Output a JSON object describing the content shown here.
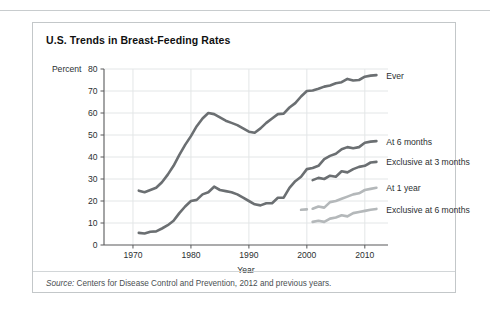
{
  "figure": {
    "title": "U.S. Trends in Breast-Feeding Rates",
    "source_prefix": "Source:",
    "source_text": " Centers for Disease Control and Prevention, 2012 and previous years."
  },
  "colors": {
    "dark_series": "#6b6f72",
    "light_series": "#b4b8ba",
    "axis": "#58595b",
    "grid": "#e3e6e7",
    "border": "#c3c7c9",
    "text": "#2b2f31"
  },
  "chart_data": {
    "type": "line",
    "title": "U.S. Trends in Breast-Feeding Rates",
    "xlabel": "Year",
    "ylabel": "Percent",
    "xlim": [
      1965,
      2014
    ],
    "ylim": [
      0,
      80
    ],
    "xticks": [
      1970,
      1980,
      1990,
      2000,
      2010
    ],
    "yticks": [
      0,
      10,
      20,
      30,
      40,
      50,
      60,
      70,
      80
    ],
    "grid": true,
    "legend": "right-inline",
    "series": [
      {
        "name": "Ever",
        "color": "#6b6f72",
        "label_x": 2013,
        "label_y": 77,
        "points": [
          [
            1971,
            24.7
          ],
          [
            1972,
            24.0
          ],
          [
            1973,
            25.0
          ],
          [
            1974,
            26.0
          ],
          [
            1975,
            28.5
          ],
          [
            1976,
            32.0
          ],
          [
            1977,
            36.0
          ],
          [
            1978,
            41.0
          ],
          [
            1979,
            45.5
          ],
          [
            1980,
            49.5
          ],
          [
            1981,
            54.0
          ],
          [
            1982,
            57.5
          ],
          [
            1983,
            60.0
          ],
          [
            1984,
            59.5
          ],
          [
            1985,
            58.0
          ],
          [
            1986,
            56.5
          ],
          [
            1987,
            55.5
          ],
          [
            1988,
            54.5
          ],
          [
            1989,
            53.0
          ],
          [
            1990,
            51.5
          ],
          [
            1991,
            51.0
          ],
          [
            1992,
            53.0
          ],
          [
            1993,
            55.5
          ],
          [
            1994,
            57.5
          ],
          [
            1995,
            59.5
          ],
          [
            1996,
            59.7
          ],
          [
            1997,
            62.5
          ],
          [
            1998,
            64.5
          ],
          [
            1999,
            67.5
          ],
          [
            2000,
            70.0
          ],
          [
            2001,
            70.2
          ],
          [
            2002,
            71.0
          ],
          [
            2003,
            72.0
          ],
          [
            2004,
            72.5
          ],
          [
            2005,
            73.5
          ],
          [
            2006,
            74.0
          ],
          [
            2007,
            75.5
          ],
          [
            2008,
            74.8
          ],
          [
            2009,
            75.0
          ],
          [
            2010,
            76.5
          ],
          [
            2011,
            77.0
          ],
          [
            2012,
            77.2
          ]
        ]
      },
      {
        "name": "At 6 months",
        "color": "#6b6f72",
        "label_x": 2013,
        "label_y": 47,
        "points": [
          [
            1971,
            5.5
          ],
          [
            1972,
            5.2
          ],
          [
            1973,
            6.0
          ],
          [
            1974,
            6.2
          ],
          [
            1975,
            7.5
          ],
          [
            1976,
            9.0
          ],
          [
            1977,
            11.0
          ],
          [
            1978,
            14.5
          ],
          [
            1979,
            17.5
          ],
          [
            1980,
            20.0
          ],
          [
            1981,
            20.5
          ],
          [
            1982,
            23.0
          ],
          [
            1983,
            24.0
          ],
          [
            1984,
            26.5
          ],
          [
            1985,
            25.0
          ],
          [
            1986,
            24.5
          ],
          [
            1987,
            24.0
          ],
          [
            1988,
            23.0
          ],
          [
            1989,
            21.5
          ],
          [
            1990,
            20.0
          ],
          [
            1991,
            18.5
          ],
          [
            1992,
            18.0
          ],
          [
            1993,
            19.0
          ],
          [
            1994,
            19.0
          ],
          [
            1995,
            21.5
          ],
          [
            1996,
            21.5
          ],
          [
            1997,
            26.0
          ],
          [
            1998,
            29.0
          ],
          [
            1999,
            31.0
          ],
          [
            2000,
            34.5
          ],
          [
            2001,
            35.0
          ],
          [
            2002,
            36.0
          ],
          [
            2003,
            39.0
          ],
          [
            2004,
            40.5
          ],
          [
            2005,
            41.5
          ],
          [
            2006,
            43.5
          ],
          [
            2007,
            44.5
          ],
          [
            2008,
            44.0
          ],
          [
            2009,
            44.5
          ],
          [
            2010,
            46.5
          ],
          [
            2011,
            47.0
          ],
          [
            2012,
            47.2
          ]
        ]
      },
      {
        "name": "Exclusive at 3 months",
        "color": "#6b6f72",
        "label_x": 2013,
        "label_y": 38,
        "points": [
          [
            2001,
            29.5
          ],
          [
            2002,
            30.5
          ],
          [
            2003,
            30.0
          ],
          [
            2004,
            31.5
          ],
          [
            2005,
            31.0
          ],
          [
            2006,
            33.5
          ],
          [
            2007,
            33.0
          ],
          [
            2008,
            34.5
          ],
          [
            2009,
            35.5
          ],
          [
            2010,
            36.0
          ],
          [
            2011,
            37.5
          ],
          [
            2012,
            37.8
          ]
        ]
      },
      {
        "name": "At 1 year",
        "color": "#b4b8ba",
        "label_x": 2013,
        "label_y": 26,
        "points": [
          [
            2001,
            16.5
          ],
          [
            2002,
            17.5
          ],
          [
            2003,
            17.0
          ],
          [
            2004,
            19.5
          ],
          [
            2005,
            20.0
          ],
          [
            2006,
            21.0
          ],
          [
            2007,
            22.0
          ],
          [
            2008,
            23.0
          ],
          [
            2009,
            23.5
          ],
          [
            2010,
            25.0
          ],
          [
            2011,
            25.5
          ],
          [
            2012,
            26.0
          ]
        ]
      },
      {
        "name": "Exclusive at 6 months",
        "color": "#b4b8ba",
        "label_x": 2013,
        "label_y": 16,
        "points": [
          [
            2001,
            10.5
          ],
          [
            2002,
            11.0
          ],
          [
            2003,
            10.5
          ],
          [
            2004,
            12.0
          ],
          [
            2005,
            12.5
          ],
          [
            2006,
            13.5
          ],
          [
            2007,
            13.0
          ],
          [
            2008,
            14.5
          ],
          [
            2009,
            15.0
          ],
          [
            2010,
            15.5
          ],
          [
            2011,
            16.0
          ],
          [
            2012,
            16.4
          ]
        ]
      },
      {
        "name": "At 1 year early segment",
        "color": "#b4b8ba",
        "detached": true,
        "points": [
          [
            1999,
            16.0
          ],
          [
            2000,
            16.2
          ]
        ]
      }
    ]
  }
}
